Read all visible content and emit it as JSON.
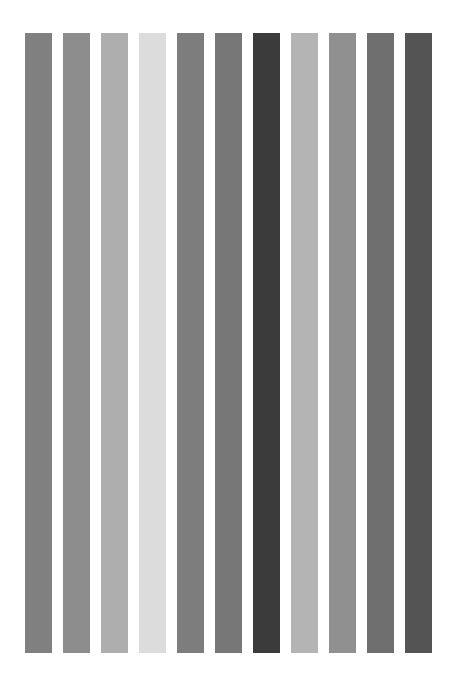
{
  "page": {
    "background_color": "#ffffff",
    "width": 454,
    "height": 680
  },
  "chart_data": {
    "type": "bar",
    "title": "",
    "subtitle": "",
    "xlabel": "",
    "ylabel": "",
    "grid": false,
    "legend": "none",
    "axis_visible": false,
    "tick_labels_visible": false,
    "orientation": "vertical",
    "background_color": "#ffffff",
    "plot_area": {
      "left": 25,
      "top": 33,
      "right": 441,
      "bottom": 653
    },
    "bar_geometry": {
      "bar_width_px": 27,
      "bar_pitch_px": 38,
      "first_bar_left_px": 25,
      "bar_top_px": 33,
      "bar_bottom_px": 653,
      "bar_height_px": 620
    },
    "categories": [
      "1",
      "2",
      "3",
      "4",
      "5",
      "6",
      "7",
      "8",
      "9",
      "10",
      "11"
    ],
    "values": [
      100,
      100,
      100,
      100,
      100,
      100,
      100,
      100,
      100,
      100,
      100
    ],
    "ylim": [
      0,
      100
    ],
    "xlim": [
      0,
      11
    ],
    "colors": [
      "#808080",
      "#8d8d8d",
      "#aeaeae",
      "#dcdcdc",
      "#7d7d7d",
      "#777777",
      "#3b3b3b",
      "#b4b4b4",
      "#909090",
      "#6f6f6f",
      "#545454"
    ],
    "bars": [
      {
        "index": 1,
        "label": "1",
        "value": 100,
        "color": "#808080",
        "gray_level": 128,
        "x_left": 25,
        "width": 27
      },
      {
        "index": 2,
        "label": "2",
        "value": 100,
        "color": "#8d8d8d",
        "gray_level": 141,
        "x_left": 63,
        "width": 27
      },
      {
        "index": 3,
        "label": "3",
        "value": 100,
        "color": "#aeaeae",
        "gray_level": 174,
        "x_left": 101,
        "width": 27
      },
      {
        "index": 4,
        "label": "4",
        "value": 100,
        "color": "#dcdcdc",
        "gray_level": 220,
        "x_left": 139,
        "width": 27
      },
      {
        "index": 5,
        "label": "5",
        "value": 100,
        "color": "#7d7d7d",
        "gray_level": 125,
        "x_left": 177,
        "width": 27
      },
      {
        "index": 6,
        "label": "6",
        "value": 100,
        "color": "#777777",
        "gray_level": 119,
        "x_left": 215,
        "width": 27
      },
      {
        "index": 7,
        "label": "7",
        "value": 100,
        "color": "#3b3b3b",
        "gray_level": 59,
        "x_left": 253,
        "width": 27
      },
      {
        "index": 8,
        "label": "8",
        "value": 100,
        "color": "#b4b4b4",
        "gray_level": 180,
        "x_left": 291,
        "width": 27
      },
      {
        "index": 9,
        "label": "9",
        "value": 100,
        "color": "#909090",
        "gray_level": 144,
        "x_left": 329,
        "width": 27
      },
      {
        "index": 10,
        "label": "10",
        "value": 100,
        "color": "#6f6f6f",
        "gray_level": 111,
        "x_left": 367,
        "width": 27
      },
      {
        "index": 11,
        "label": "11",
        "value": 100,
        "color": "#545454",
        "gray_level": 84,
        "x_left": 405,
        "width": 27
      }
    ]
  }
}
